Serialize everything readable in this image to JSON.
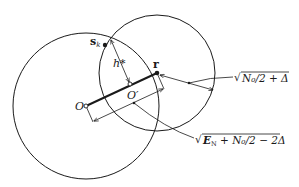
{
  "diagram": {
    "colors": {
      "stroke": "#1a1a1a",
      "background": "#ffffff"
    },
    "circles": [
      {
        "name": "large-circle",
        "center_label": "O",
        "cx": 86,
        "cy": 106,
        "r": 73
      },
      {
        "name": "small-circle",
        "center_label": "r",
        "cx": 157,
        "cy": 73,
        "r": 58
      }
    ],
    "points": {
      "O": {
        "label": "O",
        "x": 86,
        "y": 106
      },
      "O_prime": {
        "label": "O′",
        "x": 130,
        "y": 84
      },
      "r": {
        "label": "r",
        "x": 157,
        "y": 73
      },
      "s_k": {
        "label": "s",
        "subscript": "k",
        "x": 105,
        "y": 45
      },
      "intersection": {
        "x": 111,
        "y": 39
      }
    },
    "labels": {
      "h_star": "h*",
      "radius_small": {
        "sqrt": "√",
        "text": "N₀/2 + Δ"
      },
      "distance_O_r": {
        "sqrt": "√",
        "e": "E",
        "e_sub": "N",
        "rest": " + N₀/2 − 2Δ"
      }
    }
  }
}
